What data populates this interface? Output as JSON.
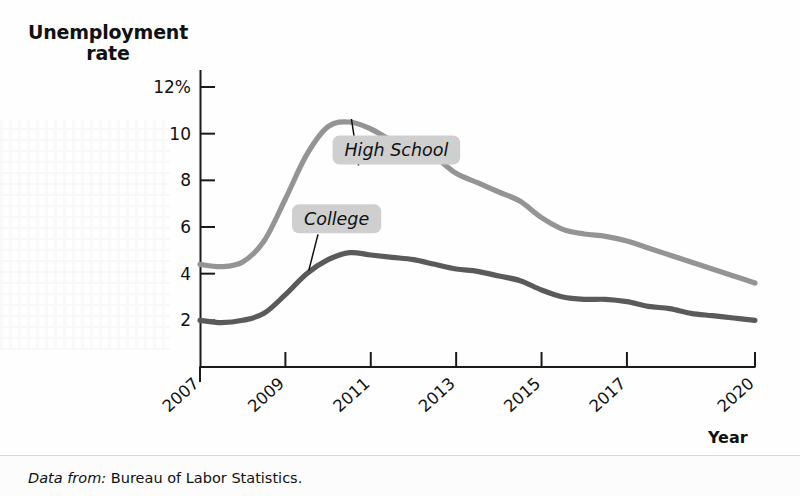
{
  "figure": {
    "y_axis_title_line1": "Unemployment",
    "y_axis_title_line2": "rate",
    "x_axis_title": "Year",
    "source_prefix": "Data from:",
    "source_text": "Bureau of Labor Statistics.",
    "colors": {
      "high_school_line": "#949494",
      "college_line": "#5a5a5a",
      "callout_background": "#cfcfcf",
      "axis": "#1a1a1a",
      "background": "#fefefe"
    }
  },
  "chart_data": {
    "type": "line",
    "title": "Unemployment rate",
    "xlabel": "Year",
    "ylabel": "Unemployment rate",
    "xlim": [
      2007,
      2020
    ],
    "ylim": [
      0,
      12
    ],
    "grid": false,
    "legend_position": "inline-callouts",
    "ytick_labels": [
      "12%",
      "10",
      "8",
      "6",
      "4",
      "2"
    ],
    "ytick_values": [
      12,
      10,
      8,
      6,
      4,
      2
    ],
    "xtick_labels": [
      "2007",
      "2009",
      "2011",
      "2013",
      "2015",
      "2017",
      "2020"
    ],
    "xtick_values": [
      2007,
      2009,
      2011,
      2013,
      2015,
      2017,
      2020
    ],
    "annotations": [
      {
        "label": "High School",
        "series": "High School",
        "x": 2011.6,
        "y": 9.3
      },
      {
        "label": "College",
        "series": "College",
        "x": 2010.2,
        "y": 6.35
      }
    ],
    "x": [
      2007,
      2007.5,
      2008,
      2008.5,
      2009,
      2009.5,
      2010,
      2010.5,
      2011,
      2011.5,
      2012,
      2012.5,
      2013,
      2013.5,
      2014,
      2014.5,
      2015,
      2015.5,
      2016,
      2016.5,
      2017,
      2017.5,
      2018,
      2018.5,
      2019,
      2019.5,
      2020
    ],
    "series": [
      {
        "name": "High School",
        "color": "#949494",
        "values": [
          4.4,
          4.3,
          4.5,
          5.4,
          7.2,
          9.1,
          10.3,
          10.5,
          10.2,
          9.7,
          9.4,
          9.0,
          8.3,
          7.9,
          7.5,
          7.1,
          6.4,
          5.9,
          5.7,
          5.6,
          5.4,
          5.1,
          4.8,
          4.5,
          4.2,
          3.9,
          3.6
        ]
      },
      {
        "name": "College",
        "color": "#5a5a5a",
        "values": [
          2.0,
          1.9,
          2.0,
          2.3,
          3.1,
          4.0,
          4.6,
          4.9,
          4.8,
          4.7,
          4.6,
          4.4,
          4.2,
          4.1,
          3.9,
          3.7,
          3.3,
          3.0,
          2.9,
          2.9,
          2.8,
          2.6,
          2.5,
          2.3,
          2.2,
          2.1,
          2.0
        ]
      }
    ]
  }
}
